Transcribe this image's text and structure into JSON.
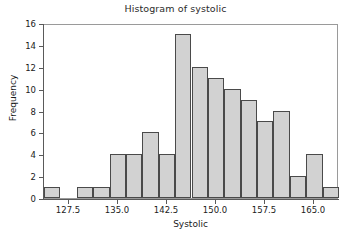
{
  "chart_data": {
    "type": "bar",
    "title": "Histogram of systolic",
    "xlabel": "Systolic",
    "ylabel": "Frequency",
    "xlim": [
      123.75,
      168.75
    ],
    "ylim": [
      0,
      16
    ],
    "grid": false,
    "legend": null,
    "bin_width": 2.5,
    "bin_edges": [
      123.75,
      126.25,
      128.75,
      131.25,
      133.75,
      136.25,
      138.75,
      141.25,
      143.75,
      146.25,
      148.75,
      151.25,
      153.75,
      156.25,
      158.75,
      161.25,
      163.75,
      166.25,
      168.75
    ],
    "categories": [
      "123.75-126.25",
      "126.25-128.75",
      "128.75-131.25",
      "131.25-133.75",
      "133.75-136.25",
      "136.25-138.75",
      "138.75-141.25",
      "141.25-143.75",
      "143.75-146.25",
      "146.25-148.75",
      "148.75-151.25",
      "151.25-153.75",
      "153.75-156.25",
      "156.25-158.75",
      "158.75-161.25",
      "161.25-163.75",
      "163.75-166.25",
      "166.25-168.75"
    ],
    "values": [
      1,
      0,
      1,
      1,
      4,
      4,
      6,
      4,
      15,
      12,
      11,
      10,
      9,
      7,
      8,
      2,
      4,
      1
    ],
    "xticks": [
      127.5,
      135.0,
      142.5,
      150.0,
      157.5,
      165.0
    ],
    "xtick_labels": [
      "127.5",
      "135.0",
      "142.5",
      "150.0",
      "157.5",
      "165.0"
    ],
    "yticks": [
      0,
      2,
      4,
      6,
      8,
      10,
      12,
      14,
      16
    ],
    "ytick_labels": [
      "0",
      "2",
      "4",
      "6",
      "8",
      "10",
      "12",
      "14",
      "16"
    ],
    "bar_fill_color": "#d2d2d2",
    "bar_edge_color": "#4a4a4a",
    "frame_color": "#9a9a9a",
    "background_color": "#ffffff"
  }
}
